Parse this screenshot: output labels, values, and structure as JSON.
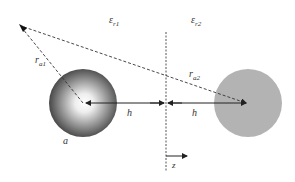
{
  "diagram": {
    "type": "image-charge geometry",
    "media": {
      "left": {
        "symbol": "ε",
        "sub": "r1"
      },
      "right": {
        "symbol": "ε",
        "sub": "r2"
      }
    },
    "interface": {
      "axis_label": "z"
    },
    "sphere_real": {
      "label": "a"
    },
    "distances": {
      "r_a1": {
        "symbol": "r",
        "sub": "a1"
      },
      "r_a2": {
        "symbol": "r",
        "sub": "a2"
      },
      "h_left": "h",
      "h_right": "h"
    },
    "colors": {
      "line": "#222222",
      "image_sphere": "#b3b3b3",
      "real_sphere_center": "#ffffff",
      "real_sphere_rim": "#3a3a3a"
    }
  }
}
